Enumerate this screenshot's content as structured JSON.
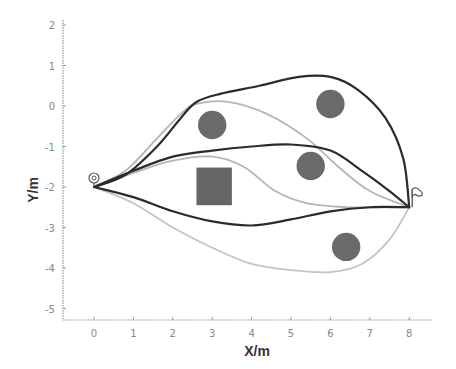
{
  "chart_data": {
    "type": "line",
    "title": "",
    "xlabel": "X/m",
    "ylabel": "Y/m",
    "xlim": [
      -0.8,
      8.6
    ],
    "ylim": [
      -5.3,
      2.1
    ],
    "x_ticks": [
      0,
      1,
      2,
      3,
      4,
      5,
      6,
      7,
      8
    ],
    "y_ticks": [
      2,
      1,
      0,
      -1,
      -2,
      -3,
      -4,
      -5
    ],
    "grid": false,
    "legend": null,
    "start": {
      "x": 0,
      "y": -2,
      "marker": "target-circle"
    },
    "goal": {
      "x": 8,
      "y": -2.5,
      "marker": "flag"
    },
    "obstacles": [
      {
        "shape": "circle",
        "cx": 3.0,
        "cy": -0.47,
        "r": 0.36
      },
      {
        "shape": "circle",
        "cx": 6.0,
        "cy": 0.05,
        "r": 0.36
      },
      {
        "shape": "circle",
        "cx": 5.5,
        "cy": -1.48,
        "r": 0.36
      },
      {
        "shape": "circle",
        "cx": 6.4,
        "cy": -3.48,
        "r": 0.36
      },
      {
        "shape": "rect",
        "x0": 2.6,
        "x1": 3.5,
        "y0": -2.45,
        "y1": -1.52
      }
    ],
    "series": [
      {
        "name": "path-top-dark",
        "color": "#2b2b2b",
        "points": [
          [
            0,
            -2
          ],
          [
            0.8,
            -1.7
          ],
          [
            1.6,
            -1.0
          ],
          [
            2.2,
            -0.3
          ],
          [
            2.6,
            0.1
          ],
          [
            3.2,
            0.3
          ],
          [
            4.2,
            0.5
          ],
          [
            5.2,
            0.72
          ],
          [
            6.0,
            0.72
          ],
          [
            6.7,
            0.4
          ],
          [
            7.4,
            -0.3
          ],
          [
            7.85,
            -1.3
          ],
          [
            8,
            -2.5
          ]
        ]
      },
      {
        "name": "path-top-light",
        "color": "#b5b5b5",
        "points": [
          [
            0,
            -2
          ],
          [
            0.8,
            -1.6
          ],
          [
            1.6,
            -0.8
          ],
          [
            2.2,
            -0.2
          ],
          [
            2.6,
            0.05
          ],
          [
            3.4,
            0.1
          ],
          [
            4.4,
            -0.2
          ],
          [
            5.4,
            -0.8
          ],
          [
            6.2,
            -1.5
          ],
          [
            7.0,
            -2.1
          ],
          [
            8,
            -2.5
          ]
        ]
      },
      {
        "name": "path-middle-dark",
        "color": "#2b2b2b",
        "points": [
          [
            0,
            -2
          ],
          [
            1.0,
            -1.6
          ],
          [
            2.0,
            -1.25
          ],
          [
            3.0,
            -1.1
          ],
          [
            4.0,
            -1.0
          ],
          [
            5.0,
            -0.95
          ],
          [
            6.0,
            -1.1
          ],
          [
            6.8,
            -1.6
          ],
          [
            7.5,
            -2.1
          ],
          [
            8,
            -2.5
          ]
        ]
      },
      {
        "name": "path-middle-light",
        "color": "#b5b5b5",
        "points": [
          [
            0,
            -2
          ],
          [
            1.0,
            -1.65
          ],
          [
            2.0,
            -1.35
          ],
          [
            3.0,
            -1.25
          ],
          [
            3.8,
            -1.5
          ],
          [
            4.6,
            -2.1
          ],
          [
            5.4,
            -2.4
          ],
          [
            6.4,
            -2.5
          ],
          [
            7.4,
            -2.5
          ],
          [
            8,
            -2.5
          ]
        ]
      },
      {
        "name": "path-bottom-dark",
        "color": "#2b2b2b",
        "points": [
          [
            0,
            -2
          ],
          [
            1.0,
            -2.25
          ],
          [
            2.0,
            -2.6
          ],
          [
            3.0,
            -2.85
          ],
          [
            4.0,
            -2.95
          ],
          [
            5.0,
            -2.8
          ],
          [
            6.0,
            -2.6
          ],
          [
            7.0,
            -2.5
          ],
          [
            8,
            -2.5
          ]
        ]
      },
      {
        "name": "path-bottom-light",
        "color": "#c4c4c4",
        "points": [
          [
            0,
            -2
          ],
          [
            1.0,
            -2.4
          ],
          [
            2.0,
            -3.0
          ],
          [
            3.0,
            -3.5
          ],
          [
            4.0,
            -3.9
          ],
          [
            5.0,
            -4.05
          ],
          [
            6.0,
            -4.1
          ],
          [
            6.8,
            -3.9
          ],
          [
            7.5,
            -3.3
          ],
          [
            8,
            -2.5
          ]
        ]
      }
    ]
  }
}
